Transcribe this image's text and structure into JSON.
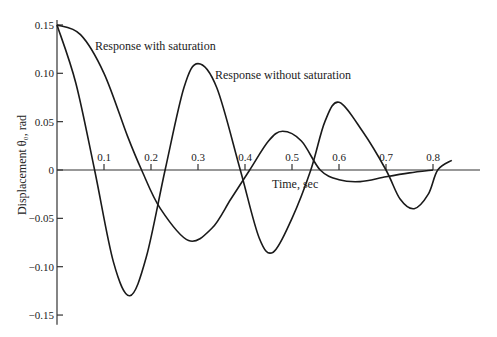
{
  "chart_data": {
    "type": "line",
    "title": "",
    "xlabel": "Time, sec",
    "ylabel": "Displacement θ₀, rad",
    "xlim": [
      0,
      0.9
    ],
    "ylim": [
      -0.15,
      0.15
    ],
    "grid": false,
    "legend": "inline annotations",
    "x_ticks": [
      "0.1",
      "0.2",
      "0.3",
      "0.4",
      "0.5",
      "0.6",
      "0.7",
      "0.8"
    ],
    "y_ticks": [
      "0.15",
      "0.10",
      "0.05",
      "0",
      "−0.05",
      "−0.10",
      "−0.15"
    ],
    "annotations": [
      "Response with saturation",
      "Response without saturation"
    ],
    "series": [
      {
        "name": "Response without saturation",
        "x": [
          0.0,
          0.04,
          0.08,
          0.12,
          0.155,
          0.19,
          0.23,
          0.27,
          0.3,
          0.34,
          0.39,
          0.43,
          0.46,
          0.5,
          0.54,
          0.57,
          0.6,
          0.65,
          0.7,
          0.73,
          0.76,
          0.79,
          0.81,
          0.84
        ],
        "values": [
          0.15,
          0.09,
          0.0,
          -0.095,
          -0.13,
          -0.09,
          0.0,
          0.085,
          0.11,
          0.085,
          0.0,
          -0.07,
          -0.085,
          -0.05,
          0.0,
          0.05,
          0.07,
          0.04,
          0.0,
          -0.03,
          -0.04,
          -0.025,
          0.0,
          0.01
        ]
      },
      {
        "name": "Response with saturation",
        "x": [
          0.0,
          0.05,
          0.1,
          0.15,
          0.18,
          0.22,
          0.28,
          0.33,
          0.37,
          0.41,
          0.45,
          0.48,
          0.52,
          0.56,
          0.6,
          0.645,
          0.7,
          0.75,
          0.8
        ],
        "values": [
          0.15,
          0.14,
          0.1,
          0.035,
          0.0,
          -0.04,
          -0.073,
          -0.06,
          -0.03,
          0.0,
          0.03,
          0.04,
          0.03,
          0.0,
          -0.01,
          -0.012,
          -0.007,
          -0.003,
          0.0
        ]
      }
    ]
  }
}
